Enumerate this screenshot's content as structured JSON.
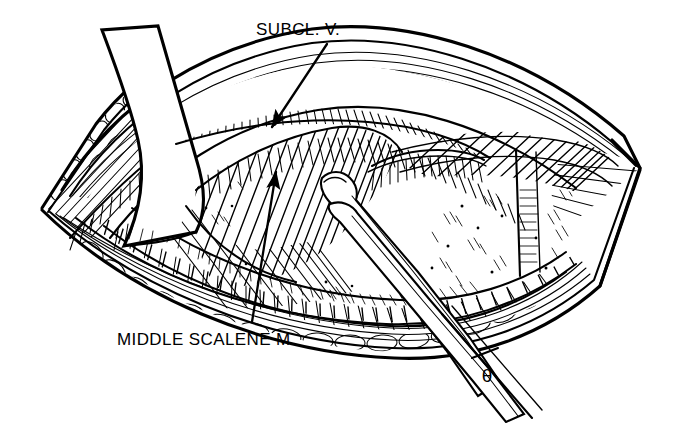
{
  "figure": {
    "kind": "anatomical-line-drawing",
    "background_color": "#ffffff",
    "ink_color": "#000000",
    "width": 674,
    "height": 423
  },
  "labels": {
    "subclavian_vein": {
      "text": "SUBCL. V.",
      "x": 256,
      "y": 35
    },
    "middle_scalene": {
      "text": "MIDDLE SCALENE M.",
      "x": 117,
      "y": 345
    },
    "theta": {
      "text": "θ",
      "x": 487,
      "y": 382
    }
  },
  "leaders": [
    {
      "name": "subclavian-vein-leader",
      "from_x": 327,
      "from_y": 44,
      "to_x": 268,
      "to_y": 133,
      "arrowhead": "end"
    },
    {
      "name": "middle-scalene-leader",
      "from_x": 252,
      "from_y": 322,
      "to_x": 277,
      "to_y": 166,
      "arrowhead": "end"
    }
  ],
  "structures": [
    {
      "name": "upper-wound-edge",
      "tissue": "skin-fat-muscle"
    },
    {
      "name": "lower-wound-edge",
      "tissue": "skin-fat-muscle"
    },
    {
      "name": "left-wound-apex",
      "tissue": "skin-fat-muscle"
    },
    {
      "name": "right-wound-apex",
      "tissue": "skin-fat-muscle"
    },
    {
      "name": "retracted-skin-flap",
      "tissue": "skin"
    },
    {
      "name": "subclavian-vein",
      "tissue": "vessel"
    },
    {
      "name": "middle-scalene-muscle",
      "tissue": "muscle"
    },
    {
      "name": "anterior-scalene-muscle",
      "tissue": "muscle"
    },
    {
      "name": "brachial-plexus-bundles",
      "tissue": "nerve"
    },
    {
      "name": "retractor-instrument",
      "tissue": "instrument"
    }
  ]
}
